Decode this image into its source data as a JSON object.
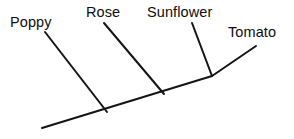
{
  "figure": {
    "type": "cladogram",
    "background_color": "#ffffff",
    "line_color": "#141414",
    "line_width": 2,
    "width": 294,
    "height": 139
  },
  "labels": {
    "poppy": "Poppy",
    "rose": "Rose",
    "sunflower": "Sunflower",
    "tomato": "Tomato"
  },
  "chart_data": {
    "type": "diagram",
    "title": "",
    "xlabel": "",
    "ylabel": "",
    "taxa": [
      "Poppy",
      "Rose",
      "Sunflower",
      "Tomato"
    ],
    "backbone": {
      "name": "main-backbone",
      "points": [
        [
          42,
          128
        ],
        [
          212,
          76
        ]
      ]
    },
    "terminal_branch": {
      "name": "tomato-branch",
      "points": [
        [
          212,
          76
        ],
        [
          256,
          46
        ]
      ]
    },
    "branches": [
      {
        "taxon": "Poppy",
        "node": [
          107,
          112
        ],
        "tip": [
          45,
          32
        ],
        "label_position": [
          10,
          15
        ]
      },
      {
        "taxon": "Rose",
        "node": [
          164,
          94
        ],
        "tip": [
          104,
          23
        ],
        "label_position": [
          86,
          5
        ]
      },
      {
        "taxon": "Sunflower",
        "node": [
          212,
          76
        ],
        "tip": [
          192,
          23
        ],
        "label_position": [
          147,
          5
        ]
      },
      {
        "taxon": "Tomato",
        "node": [
          212,
          76
        ],
        "tip": [
          256,
          46
        ],
        "label_position": [
          228,
          25
        ]
      }
    ]
  }
}
